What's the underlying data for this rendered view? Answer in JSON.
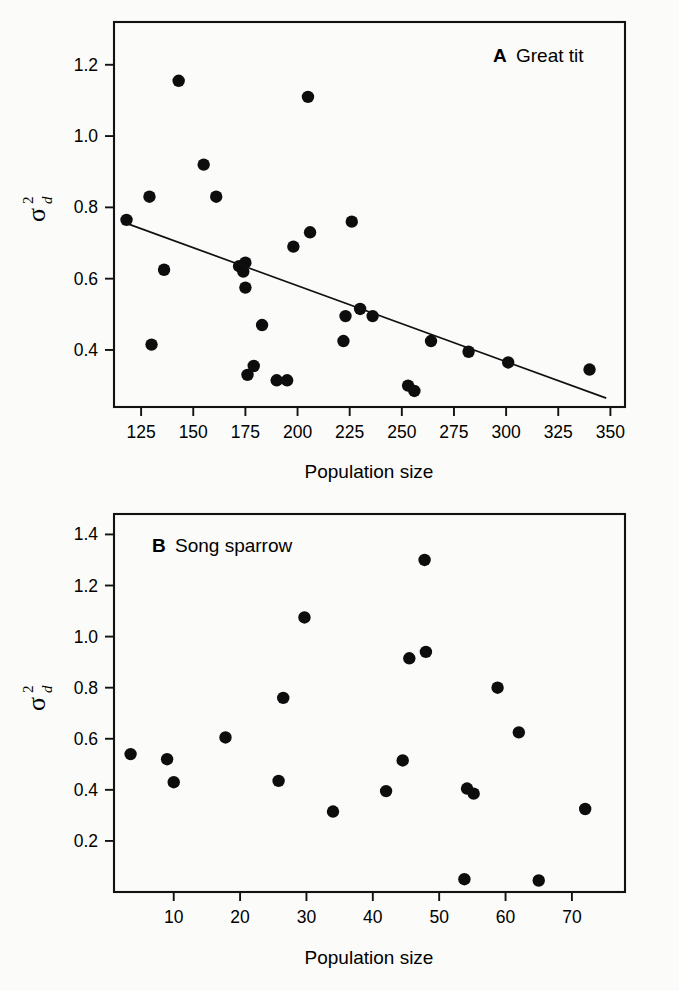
{
  "figure": {
    "background_color": "#fbfbf9",
    "point_color": "#0d0d0d",
    "axis_color": "#121212"
  },
  "panel_a": {
    "label_letter": "A",
    "label_text": "Great tit",
    "xlabel": "Population size",
    "ylabel_symbol": "σ",
    "ylabel_superscript": "2",
    "ylabel_subscript": "d"
  },
  "panel_b": {
    "label_letter": "B",
    "label_text": "Song sparrow",
    "xlabel": "Population size",
    "ylabel_symbol": "σ",
    "ylabel_superscript": "2",
    "ylabel_subscript": "d"
  },
  "chart_data": [
    {
      "type": "scatter",
      "panel": "A",
      "title": "A  Great tit",
      "xlabel": "Population size",
      "ylabel": "σ²d",
      "xlim": [
        112,
        357
      ],
      "ylim": [
        0.24,
        1.32
      ],
      "xticks": [
        125,
        150,
        175,
        200,
        225,
        250,
        275,
        300,
        325,
        350
      ],
      "xtick_labels": [
        "125",
        "150",
        "175",
        "200",
        "225",
        "250",
        "275",
        "300",
        "325",
        "350"
      ],
      "yticks": [
        0.4,
        0.6,
        0.8,
        1.0,
        1.2
      ],
      "ytick_labels": [
        "0.4",
        "0.6",
        "0.8",
        "1.0",
        "1.2"
      ],
      "grid": false,
      "legend": false,
      "points": [
        {
          "x": 118,
          "y": 0.765
        },
        {
          "x": 129,
          "y": 0.83
        },
        {
          "x": 130,
          "y": 0.415
        },
        {
          "x": 136,
          "y": 0.625
        },
        {
          "x": 143,
          "y": 1.155
        },
        {
          "x": 155,
          "y": 0.92
        },
        {
          "x": 161,
          "y": 0.83
        },
        {
          "x": 172,
          "y": 0.635
        },
        {
          "x": 174,
          "y": 0.62
        },
        {
          "x": 175,
          "y": 0.645
        },
        {
          "x": 175,
          "y": 0.575
        },
        {
          "x": 176,
          "y": 0.33
        },
        {
          "x": 179,
          "y": 0.355
        },
        {
          "x": 183,
          "y": 0.47
        },
        {
          "x": 190,
          "y": 0.315
        },
        {
          "x": 195,
          "y": 0.315
        },
        {
          "x": 198,
          "y": 0.69
        },
        {
          "x": 205,
          "y": 1.11
        },
        {
          "x": 206,
          "y": 0.73
        },
        {
          "x": 222,
          "y": 0.425
        },
        {
          "x": 223,
          "y": 0.495
        },
        {
          "x": 226,
          "y": 0.76
        },
        {
          "x": 230,
          "y": 0.515
        },
        {
          "x": 236,
          "y": 0.495
        },
        {
          "x": 253,
          "y": 0.3
        },
        {
          "x": 256,
          "y": 0.285
        },
        {
          "x": 264,
          "y": 0.425
        },
        {
          "x": 282,
          "y": 0.395
        },
        {
          "x": 301,
          "y": 0.365
        },
        {
          "x": 340,
          "y": 0.345
        }
      ],
      "fit_line": {
        "x0": 118,
        "y0": 0.755,
        "x1": 348,
        "y1": 0.265
      }
    },
    {
      "type": "scatter",
      "panel": "B",
      "title": "B  Song sparrow",
      "xlabel": "Population size",
      "ylabel": "σ²d",
      "xlim": [
        1,
        78
      ],
      "ylim": [
        0.0,
        1.48
      ],
      "xticks": [
        10,
        20,
        30,
        40,
        50,
        60,
        70
      ],
      "xtick_labels": [
        "10",
        "20",
        "30",
        "40",
        "50",
        "60",
        "70"
      ],
      "yticks": [
        0.2,
        0.4,
        0.6,
        0.8,
        1.0,
        1.2,
        1.4
      ],
      "ytick_labels": [
        "0.2",
        "0.4",
        "0.6",
        "0.8",
        "1.0",
        "1.2",
        "1.4"
      ],
      "grid": false,
      "legend": false,
      "points": [
        {
          "x": 3.5,
          "y": 0.54
        },
        {
          "x": 9.0,
          "y": 0.52
        },
        {
          "x": 10.0,
          "y": 0.43
        },
        {
          "x": 17.8,
          "y": 0.605
        },
        {
          "x": 25.8,
          "y": 0.435
        },
        {
          "x": 26.5,
          "y": 0.76
        },
        {
          "x": 29.7,
          "y": 1.075
        },
        {
          "x": 34.0,
          "y": 0.315
        },
        {
          "x": 42.0,
          "y": 0.395
        },
        {
          "x": 44.5,
          "y": 0.515
        },
        {
          "x": 45.5,
          "y": 0.915
        },
        {
          "x": 47.8,
          "y": 1.3
        },
        {
          "x": 48.0,
          "y": 0.94
        },
        {
          "x": 53.8,
          "y": 0.05
        },
        {
          "x": 54.2,
          "y": 0.405
        },
        {
          "x": 55.2,
          "y": 0.385
        },
        {
          "x": 58.8,
          "y": 0.8
        },
        {
          "x": 62.0,
          "y": 0.625
        },
        {
          "x": 65.0,
          "y": 0.045
        },
        {
          "x": 72.0,
          "y": 0.325
        }
      ],
      "fit_line": null
    }
  ]
}
